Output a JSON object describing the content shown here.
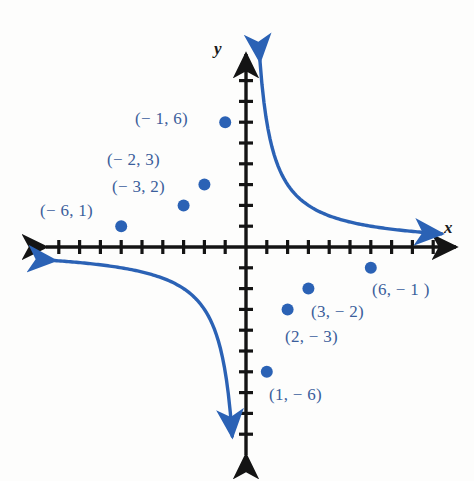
{
  "figure": {
    "width": 474,
    "height": 481,
    "background": "#fdfdfc"
  },
  "axes": {
    "x_label": "x",
    "y_label": "y",
    "x_label_pos": [
      444,
      219
    ],
    "y_label_pos": [
      214,
      40
    ],
    "origin": [
      246,
      247
    ],
    "unit_px": 20.8,
    "axis_color": "#141414",
    "tick_half_len": 7,
    "x_tick_values": [
      -9,
      -8,
      -7,
      -6,
      -5,
      -4,
      -3,
      -2,
      -1,
      1,
      2,
      3,
      4,
      5,
      6,
      7,
      8,
      9
    ],
    "y_tick_values": [
      -9,
      -8,
      -7,
      -6,
      -5,
      -4,
      -3,
      -2,
      -1,
      1,
      2,
      3,
      4,
      5,
      6,
      7,
      8
    ],
    "x_axis_extent_px": [
      40,
      462
    ],
    "y_axis_extent_px": [
      48,
      462
    ],
    "arrows": "both-ends-both-axes"
  },
  "curve": {
    "color": "#2b62b5",
    "stroke_width": 3.4,
    "point_radius": 6,
    "equation_note": "y = 6/x",
    "arrow_tips": {
      "upper_branch_top": [
        229,
        60
      ],
      "upper_branch_left": [
        54,
        233
      ],
      "lower_branch_bottom": [
        261,
        443
      ],
      "lower_branch_right": [
        442,
        266
      ]
    }
  },
  "chart_data": {
    "type": "line",
    "title": "",
    "xlabel": "x",
    "ylabel": "y",
    "xlim": [
      -10,
      10
    ],
    "ylim": [
      -10,
      10
    ],
    "grid": false,
    "legend": "none",
    "series": [
      {
        "name": "left branch",
        "points": [
          {
            "x": -6,
            "y": 1,
            "label": "(− 6, 1)",
            "label_pos": [
              40,
              202
            ]
          },
          {
            "x": -3,
            "y": 2,
            "label": "(− 3, 2)",
            "label_pos": [
              112,
              178
            ]
          },
          {
            "x": -2,
            "y": 3,
            "label": "(− 2, 3)",
            "label_pos": [
              107,
              151
            ]
          },
          {
            "x": -1,
            "y": 6,
            "label": "(− 1, 6)",
            "label_pos": [
              135,
              110
            ]
          }
        ]
      },
      {
        "name": "right branch",
        "points": [
          {
            "x": 1,
            "y": -6,
            "label": "(1, − 6)",
            "label_pos": [
              269,
              386
            ]
          },
          {
            "x": 2,
            "y": -3,
            "label": "(2, − 3)",
            "label_pos": [
              285,
              328
            ]
          },
          {
            "x": 3,
            "y": -2,
            "label": "(3, − 2)",
            "label_pos": [
              311,
              303
            ]
          },
          {
            "x": 6,
            "y": -1,
            "label": "(6, − 1 )",
            "label_pos": [
              372,
              281
            ]
          }
        ]
      }
    ]
  }
}
